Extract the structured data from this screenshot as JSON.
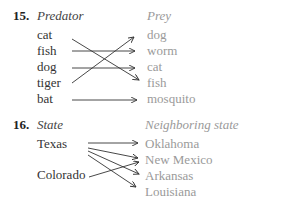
{
  "problems": [
    {
      "number": "15.",
      "left_header": "Predator",
      "right_header": "Prey",
      "left_items": [
        "cat",
        "fish",
        "dog",
        "tiger",
        "bat"
      ],
      "right_items": [
        "dog",
        "worm",
        "cat",
        "fish",
        "mosquito"
      ],
      "mappings": [
        {
          "from": "cat",
          "to": "fish"
        },
        {
          "from": "fish",
          "to": "worm"
        },
        {
          "from": "dog",
          "to": "cat"
        },
        {
          "from": "tiger",
          "to": "dog"
        },
        {
          "from": "bat",
          "to": "mosquito"
        }
      ]
    },
    {
      "number": "16.",
      "left_header": "State",
      "right_header": "Neighboring state",
      "left_items": [
        "Texas",
        "Colorado"
      ],
      "right_items": [
        "Oklahoma",
        "New Mexico",
        "Arkansas",
        "Louisiana"
      ],
      "mappings": [
        {
          "from": "Texas",
          "to": "Oklahoma"
        },
        {
          "from": "Texas",
          "to": "New Mexico"
        },
        {
          "from": "Texas",
          "to": "Arkansas"
        },
        {
          "from": "Texas",
          "to": "Louisiana"
        },
        {
          "from": "Colorado",
          "to": "New Mexico"
        }
      ]
    }
  ],
  "colors": {
    "left_text": "#333333",
    "right_text": "#9a9a9a",
    "arrow": "#333333"
  }
}
